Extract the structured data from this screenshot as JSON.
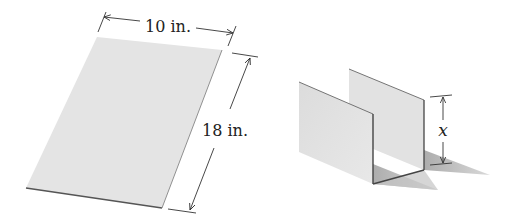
{
  "diagram": {
    "flat_sheet": {
      "width_label": "10 in.",
      "length_label": "18 in."
    },
    "folded_channel": {
      "height_label": "x"
    }
  },
  "colors": {
    "sheet_fill": "#e4e4e4",
    "edge": "#444444",
    "shadow": "#b9b9b9",
    "dimension_line": "#333333",
    "text": "#222222"
  }
}
